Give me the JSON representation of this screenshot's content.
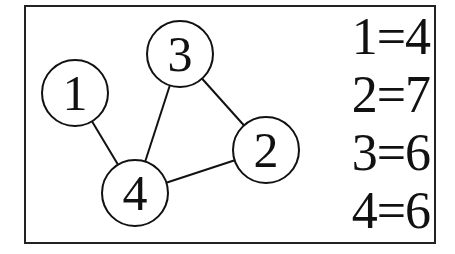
{
  "diagram": {
    "nodes": [
      {
        "id": "1",
        "label": "1",
        "cx": 75,
        "cy": 93
      },
      {
        "id": "2",
        "label": "2",
        "cx": 266,
        "cy": 150
      },
      {
        "id": "3",
        "label": "3",
        "cx": 180,
        "cy": 54
      },
      {
        "id": "4",
        "label": "4",
        "cx": 135,
        "cy": 193
      }
    ],
    "edges": [
      {
        "from": "1",
        "to": "4"
      },
      {
        "from": "3",
        "to": "4"
      },
      {
        "from": "3",
        "to": "2"
      },
      {
        "from": "4",
        "to": "2"
      }
    ],
    "node_radius": 33
  },
  "legend": {
    "items": [
      {
        "text": "1=4"
      },
      {
        "text": "2=7"
      },
      {
        "text": "3=6"
      },
      {
        "text": "4=6"
      }
    ]
  }
}
